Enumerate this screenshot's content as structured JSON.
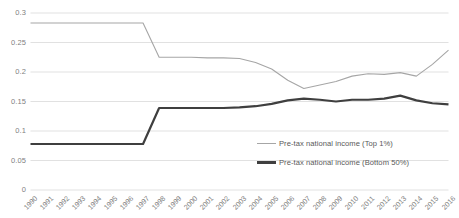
{
  "chart_data": {
    "type": "line",
    "title": "",
    "xlabel": "",
    "ylabel": "",
    "grid": true,
    "legend_position": "inside-center-right",
    "ylim": [
      0,
      0.3
    ],
    "yticks": [
      "0",
      "0.05",
      "0.1",
      "0.15",
      "0.2",
      "0.25",
      "0.3"
    ],
    "ytick_values": [
      0,
      0.05,
      0.1,
      0.15,
      0.2,
      0.25,
      0.3
    ],
    "categories": [
      "1990",
      "1991",
      "1992",
      "1993",
      "1994",
      "1995",
      "1996",
      "1997",
      "1998",
      "1999",
      "2000",
      "2001",
      "2002",
      "2003",
      "2004",
      "2005",
      "2006",
      "2007",
      "2008",
      "2009",
      "2010",
      "2011",
      "2012",
      "2013",
      "2014",
      "2015",
      "2016"
    ],
    "series": [
      {
        "name": "Pre-tax national income (Top 1%)",
        "color": "#a6a6a6",
        "width": 1.1,
        "values": [
          0.283,
          0.283,
          0.283,
          0.283,
          0.283,
          0.283,
          0.283,
          0.283,
          0.225,
          0.225,
          0.225,
          0.224,
          0.224,
          0.223,
          0.216,
          0.205,
          0.186,
          0.172,
          0.178,
          0.184,
          0.193,
          0.197,
          0.196,
          0.199,
          0.193,
          0.213,
          0.237
        ]
      },
      {
        "name": "Pre-tax national income (Bottom 50%)",
        "color": "#3f3f3f",
        "width": 2.2,
        "values": [
          0.078,
          0.078,
          0.078,
          0.078,
          0.078,
          0.078,
          0.078,
          0.078,
          0.139,
          0.139,
          0.139,
          0.139,
          0.139,
          0.14,
          0.142,
          0.146,
          0.152,
          0.155,
          0.153,
          0.15,
          0.153,
          0.153,
          0.155,
          0.16,
          0.152,
          0.147,
          0.145
        ]
      }
    ]
  },
  "legend": {
    "items": [
      {
        "label": "Pre-tax national income (Top 1%)"
      },
      {
        "label": "Pre-tax national income (Bottom 50%)"
      }
    ]
  }
}
